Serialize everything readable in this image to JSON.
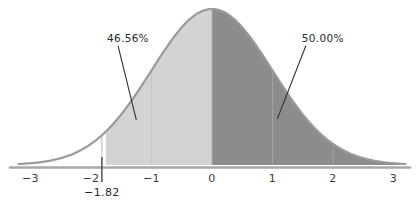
{
  "chart_data": {
    "type": "area",
    "title": "",
    "subtitle": "",
    "xlabel": "",
    "ylabel": "",
    "distribution": "standard normal",
    "mean": 0,
    "sd": 1,
    "xlim": [
      -3.2,
      3.2
    ],
    "ylim": [
      0,
      0.42
    ],
    "grid": true,
    "legend": null,
    "x_ticks": [
      {
        "value": -3,
        "label": "−3"
      },
      {
        "value": -2,
        "label": "−2"
      },
      {
        "value": -1,
        "label": "−1"
      },
      {
        "value": 0,
        "label": "0"
      },
      {
        "value": 1,
        "label": "1"
      },
      {
        "value": 2,
        "label": "2"
      },
      {
        "value": 3,
        "label": "3"
      }
    ],
    "special_ticks": [
      {
        "value": -1.82,
        "label": "−1.82"
      }
    ],
    "regions": [
      {
        "name": "left-region",
        "from": -1.82,
        "to": 0,
        "area_label": "46.56%",
        "color": "#d3d3d3"
      },
      {
        "name": "right-region",
        "from": 0,
        "to": 3.2,
        "area_label": "50.00%",
        "color": "#8c8c8c"
      }
    ],
    "annotations": [
      {
        "name": "left-area-callout",
        "text": "46.56%",
        "text_x": -1.85,
        "text_y": 0.315,
        "point_x": -1.25,
        "point_y": 0.115
      },
      {
        "name": "right-area-callout",
        "text": "50.00%",
        "text_x": 1.32,
        "text_y": 0.315,
        "point_x": 1.08,
        "point_y": 0.118
      }
    ],
    "colors": {
      "left_fill": "#d3d3d3",
      "right_fill": "#8c8c8c",
      "curve_line": "#9a9a9a",
      "axis_line": "#a8a8a8",
      "grid_line": "#c3c3c3",
      "text": "#2a2a2a",
      "background": "#ffffff"
    }
  },
  "axis": {
    "tick_labels": [
      "−3",
      "−2",
      "−1",
      "0",
      "1",
      "2",
      "3"
    ],
    "special_tick_label": "−1.82"
  },
  "labels": {
    "left_area": "46.56%",
    "right_area": "50.00%"
  }
}
